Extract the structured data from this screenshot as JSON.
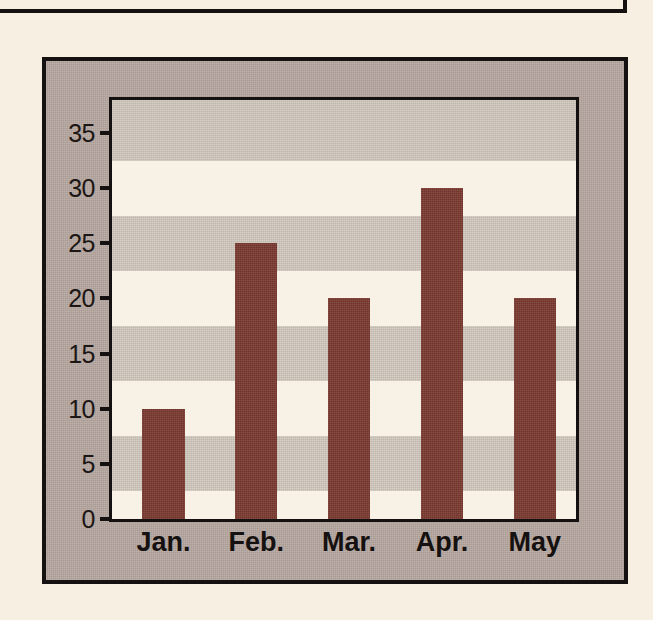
{
  "page": {
    "background_color": "#F7F0E2",
    "upper_box_edge": "rule"
  },
  "figure": {
    "frame_color": "#151110",
    "panel_color": "#B5A69F",
    "plot_background_color": "#F7F1E6",
    "band_color": "#CBC2B7",
    "bar_color": "#7C3A30"
  },
  "chart_data": {
    "type": "bar",
    "title": "",
    "xlabel": "",
    "ylabel": "",
    "categories": [
      "Jan.",
      "Feb.",
      "Mar.",
      "Apr.",
      "May"
    ],
    "values": [
      10,
      25,
      20,
      30,
      20
    ],
    "ylim": [
      0,
      38
    ],
    "yticks": [
      0,
      5,
      10,
      15,
      20,
      25,
      30,
      35
    ],
    "ytick_labels": [
      "0",
      "5",
      "10",
      "15",
      "20",
      "25",
      "30",
      "35"
    ],
    "grid": "alternating-horizontal-bands",
    "legend": "none",
    "bands": [
      {
        "from": 2.5,
        "to": 7.5
      },
      {
        "from": 12.5,
        "to": 17.5
      },
      {
        "from": 22.5,
        "to": 27.5
      },
      {
        "from": 32.5,
        "to": 38
      }
    ]
  }
}
